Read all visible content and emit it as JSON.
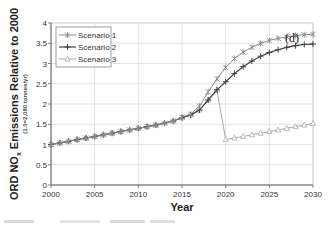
{
  "chart_data": {
    "type": "line",
    "title": "",
    "annotation": "(d)",
    "xlabel": "Year",
    "ylabel": "ORD NOx Emissions Relative to 2000",
    "ylabel_sub": "(1.0=2,080 tonnes/yr)",
    "xlim": [
      2000,
      2030
    ],
    "ylim": [
      0,
      4
    ],
    "x_ticks": [
      2000,
      2005,
      2010,
      2015,
      2020,
      2025,
      2030
    ],
    "y_ticks": [
      0,
      0.5,
      1,
      1.5,
      2,
      2.5,
      3,
      3.5,
      4
    ],
    "y_tick_labels": [
      "0",
      "0.5",
      "1",
      "1.5",
      "2",
      "2.5",
      "3",
      "3.5",
      "4"
    ],
    "grid": true,
    "legend_position": "upper left",
    "x": [
      2000,
      2001,
      2002,
      2003,
      2004,
      2005,
      2006,
      2007,
      2008,
      2009,
      2010,
      2011,
      2012,
      2013,
      2014,
      2015,
      2016,
      2017,
      2018,
      2019,
      2020,
      2021,
      2022,
      2023,
      2024,
      2025,
      2026,
      2027,
      2028,
      2029,
      2030
    ],
    "series": [
      {
        "name": "Scenario 1",
        "color": "#8a8a8a",
        "marker": "x-star",
        "values": [
          1.0,
          1.04,
          1.08,
          1.12,
          1.16,
          1.2,
          1.24,
          1.28,
          1.32,
          1.36,
          1.4,
          1.44,
          1.48,
          1.53,
          1.58,
          1.68,
          1.75,
          1.95,
          2.3,
          2.62,
          2.9,
          3.12,
          3.28,
          3.4,
          3.5,
          3.57,
          3.62,
          3.66,
          3.69,
          3.71,
          3.72
        ]
      },
      {
        "name": "Scenario 2",
        "color": "#404040",
        "marker": "plus",
        "values": [
          1.0,
          1.04,
          1.08,
          1.12,
          1.16,
          1.2,
          1.24,
          1.28,
          1.32,
          1.36,
          1.4,
          1.44,
          1.48,
          1.53,
          1.58,
          1.66,
          1.73,
          1.85,
          2.1,
          2.35,
          2.55,
          2.75,
          2.92,
          3.06,
          3.18,
          3.27,
          3.34,
          3.4,
          3.44,
          3.47,
          3.48
        ]
      },
      {
        "name": "Scenario 3",
        "color": "#aaaaaa",
        "marker": "triangle",
        "values": [
          1.0,
          1.04,
          1.08,
          1.12,
          1.16,
          1.2,
          1.24,
          1.28,
          1.32,
          1.36,
          1.4,
          1.44,
          1.48,
          1.53,
          1.58,
          1.66,
          1.73,
          1.85,
          2.1,
          2.35,
          1.12,
          1.16,
          1.2,
          1.24,
          1.28,
          1.32,
          1.36,
          1.4,
          1.44,
          1.48,
          1.52
        ]
      }
    ]
  },
  "labels": {
    "annotation": "(d)",
    "xlabel": "Year",
    "ylabel_main": "ORD NO",
    "ylabel_sub_x": "x",
    "ylabel_rest": " Emissions Relative to 2000",
    "ylabel_sub": "(1.0=2,080 tonnes/yr)"
  }
}
